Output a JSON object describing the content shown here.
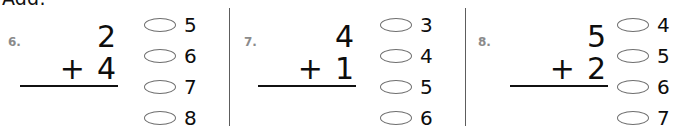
{
  "worksheet": {
    "instruction": "Add.",
    "dividers": [
      "column-divider-1",
      "column-divider-2"
    ],
    "problems": [
      {
        "number": "6.",
        "top_addend": "2",
        "operator": "+",
        "bottom_addend": "4",
        "rule": "answer-line",
        "choices": [
          {
            "label": "5",
            "selected": false
          },
          {
            "label": "6",
            "selected": false
          },
          {
            "label": "7",
            "selected": false
          },
          {
            "label": "8",
            "selected": false
          }
        ]
      },
      {
        "number": "7.",
        "top_addend": "4",
        "operator": "+",
        "bottom_addend": "1",
        "rule": "answer-line",
        "choices": [
          {
            "label": "3",
            "selected": false
          },
          {
            "label": "4",
            "selected": false
          },
          {
            "label": "5",
            "selected": false
          },
          {
            "label": "6",
            "selected": false
          }
        ]
      },
      {
        "number": "8.",
        "top_addend": "5",
        "operator": "+",
        "bottom_addend": "2",
        "rule": "answer-line",
        "choices": [
          {
            "label": "4",
            "selected": false
          },
          {
            "label": "5",
            "selected": false
          },
          {
            "label": "6",
            "selected": false
          },
          {
            "label": "7",
            "selected": false
          }
        ]
      }
    ],
    "colors": {
      "page_background": "#ffffff",
      "digit_ink": "#0d0d0d",
      "problem_number": "#8b8b8b",
      "bubble_outline": "#6e6e6e",
      "divider": "#5d5d5d"
    }
  }
}
